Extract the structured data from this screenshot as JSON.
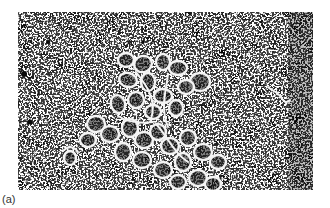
{
  "figure": {
    "panel_label": "(a)",
    "image": {
      "type": "electron-micrograph",
      "subject": "looped DNA rosette structure",
      "palette": {
        "background": "#3a3a3a",
        "strand": "#f4f4f4",
        "speckle": "#e8e8e8",
        "page": "#ffffff"
      }
    }
  }
}
